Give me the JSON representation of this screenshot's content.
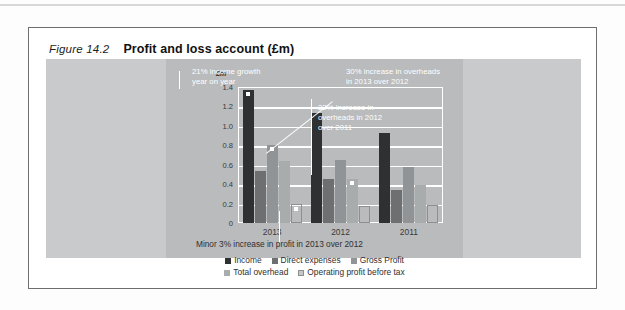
{
  "figure": {
    "number": "Figure 14.2",
    "title": "Profit and loss account (£m)"
  },
  "colors": {
    "income": "#2f3032",
    "direct_expenses": "#6d6f71",
    "gross_profit": "#919496",
    "total_overhead": "#a9acad",
    "operating_profit": "#c4c6c7",
    "page_background": "#fdfdfd",
    "plate": "#c9cacb",
    "canvas": "#b9bbbc",
    "gridline": "#ffffff",
    "annotation_text": "#ffffff",
    "caption_text": "#2f2f2f"
  },
  "chart_data": {
    "type": "bar",
    "title": "Profit and loss account (£m)",
    "xlabel": "",
    "ylabel": "£m",
    "ylim": [
      0,
      1.4
    ],
    "yticks": [
      "0",
      "0.2",
      "0.4",
      "0.6",
      "0.8",
      "1.0",
      "1.2",
      "1.4"
    ],
    "ytick_values": [
      0,
      0.2,
      0.4,
      0.6,
      0.8,
      1.0,
      1.2,
      1.4
    ],
    "grid": true,
    "legend_position": "bottom",
    "categories": [
      "2013",
      "2012",
      "2011"
    ],
    "series": [
      {
        "name": "Income",
        "values": [
          1.37,
          1.13,
          0.93
        ]
      },
      {
        "name": "Direct expenses",
        "values": [
          0.54,
          0.45,
          0.34
        ]
      },
      {
        "name": "Gross Profit",
        "values": [
          0.8,
          0.65,
          0.58
        ]
      },
      {
        "name": "Total overhead",
        "values": [
          0.64,
          0.45,
          0.39
        ]
      },
      {
        "name": "Operating profit before tax",
        "values": [
          0.2,
          0.18,
          0.19
        ]
      }
    ],
    "annotations": [
      "21% income growth\nyear on year",
      "30% increase in overheads\nin 2013 over 2012",
      "22% increase in\noverheads in 2012\nover 2011",
      "Minor 3% increase in profit in 2013 over 2012"
    ]
  },
  "legend": {
    "row1": [
      "Income",
      "Direct expenses",
      "Gross Profit"
    ],
    "row2": [
      "Total overhead",
      "Operating profit before tax"
    ]
  }
}
